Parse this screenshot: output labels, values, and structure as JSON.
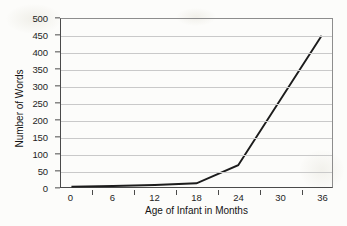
{
  "chart_data": {
    "type": "line",
    "title": "",
    "xlabel": "Age of Infant in Months",
    "ylabel": "Number of Words",
    "x": [
      0,
      6,
      12,
      18,
      24,
      36
    ],
    "xlim": [
      -1.5,
      37.5
    ],
    "ylim": [
      0,
      500
    ],
    "grid": true,
    "legend": false,
    "xticks": [
      0,
      6,
      12,
      18,
      24,
      30,
      36
    ],
    "xtick_labels": [
      "0",
      "6",
      "12",
      "18",
      "24",
      "30",
      "36"
    ],
    "yticks": [
      0,
      50,
      100,
      150,
      200,
      250,
      300,
      350,
      400,
      450,
      500
    ],
    "ytick_labels": [
      "0",
      "50",
      "100",
      "150",
      "200",
      "250",
      "300",
      "350",
      "400",
      "450",
      "500"
    ],
    "series": [
      {
        "name": "Vocabulary growth",
        "values": [
          1,
          3,
          6,
          11,
          65,
          450
        ],
        "color": "#1c1c1c"
      }
    ]
  },
  "axes": {
    "y_title": "Number of Words",
    "x_title": "Age of Infant in Months"
  },
  "style": {
    "line_color": "#1c1c1c",
    "grid_color": "#c9c9c9",
    "axis_color": "#4a4a4a",
    "background": "#fcfcfa",
    "text_color": "#1e1e1e"
  }
}
